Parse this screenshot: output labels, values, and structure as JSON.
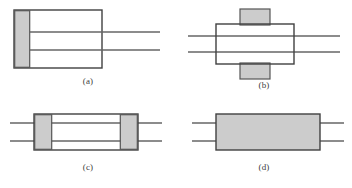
{
  "figure": {
    "type": "schematic-diagram",
    "panel_count": 4,
    "layout": "2x2 grid",
    "background_color": "#ffffff",
    "shading_fill_color": "#cccccc",
    "shading_edge_color": "#555555",
    "outline_color": "#404040",
    "line_color": "#666666",
    "caption_color": "#404040"
  },
  "panels": [
    {
      "id": "a",
      "caption": "(a)",
      "description": "Rectangle with shaded region at left end; two horizontal lines extend to the right beyond the rectangle",
      "shaded_regions": [
        "left-end"
      ],
      "rect": {
        "x": 14,
        "y": 10,
        "w": 88,
        "h": 58
      },
      "shading": [
        {
          "x": 14,
          "y": 10,
          "w": 16,
          "h": 58
        }
      ],
      "lines": [
        {
          "x1": 30,
          "y1": 32,
          "x2": 160,
          "y2": 32
        },
        {
          "x1": 30,
          "y1": 50,
          "x2": 160,
          "y2": 50
        }
      ],
      "caption_x": 0,
      "caption_y": 76
    },
    {
      "id": "b",
      "caption": "(b)",
      "description": "Rectangle with shaded blocks above and below the center; two horizontal lines pass through from left to right",
      "shaded_regions": [
        "top-center",
        "bottom-center"
      ],
      "rect": {
        "x": 216,
        "y": 24,
        "w": 78,
        "h": 40
      },
      "shading": [
        {
          "x": 240,
          "y": 9,
          "w": 30,
          "h": 15
        },
        {
          "x": 240,
          "y": 64,
          "w": 30,
          "h": 15
        }
      ],
      "lines": [
        {
          "x1": 188,
          "y1": 36,
          "x2": 340,
          "y2": 36
        },
        {
          "x1": 188,
          "y1": 52,
          "x2": 340,
          "y2": 52
        }
      ],
      "caption_x": 176,
      "caption_y": 80
    },
    {
      "id": "c",
      "caption": "(c)",
      "description": "Rectangle with shaded blocks at both left and right ends; two horizontal lines pass through and extend out both sides",
      "shaded_regions": [
        "left-end",
        "right-end"
      ],
      "rect": {
        "x": 34,
        "y": 114,
        "w": 104,
        "h": 36
      },
      "shading": [
        {
          "x": 34,
          "y": 114,
          "w": 18,
          "h": 36
        },
        {
          "x": 120,
          "y": 114,
          "w": 18,
          "h": 36
        }
      ],
      "lines": [
        {
          "x1": 10,
          "y1": 123,
          "x2": 162,
          "y2": 123
        },
        {
          "x1": 10,
          "y1": 141,
          "x2": 162,
          "y2": 141
        }
      ],
      "caption_x": 0,
      "caption_y": 162
    },
    {
      "id": "d",
      "caption": "(d)",
      "description": "Fully shaded rectangle with short horizontal line stubs on both left and right sides",
      "shaded_regions": [
        "entire-rectangle"
      ],
      "rect": {
        "x": 216,
        "y": 114,
        "w": 104,
        "h": 36
      },
      "shading": [
        {
          "x": 216,
          "y": 114,
          "w": 104,
          "h": 36
        }
      ],
      "lines": [
        {
          "x1": 192,
          "y1": 123,
          "x2": 216,
          "y2": 123
        },
        {
          "x1": 192,
          "y1": 141,
          "x2": 216,
          "y2": 141
        },
        {
          "x1": 320,
          "y1": 123,
          "x2": 344,
          "y2": 123
        },
        {
          "x1": 320,
          "y1": 141,
          "x2": 344,
          "y2": 141
        }
      ],
      "caption_x": 176,
      "caption_y": 162
    }
  ]
}
